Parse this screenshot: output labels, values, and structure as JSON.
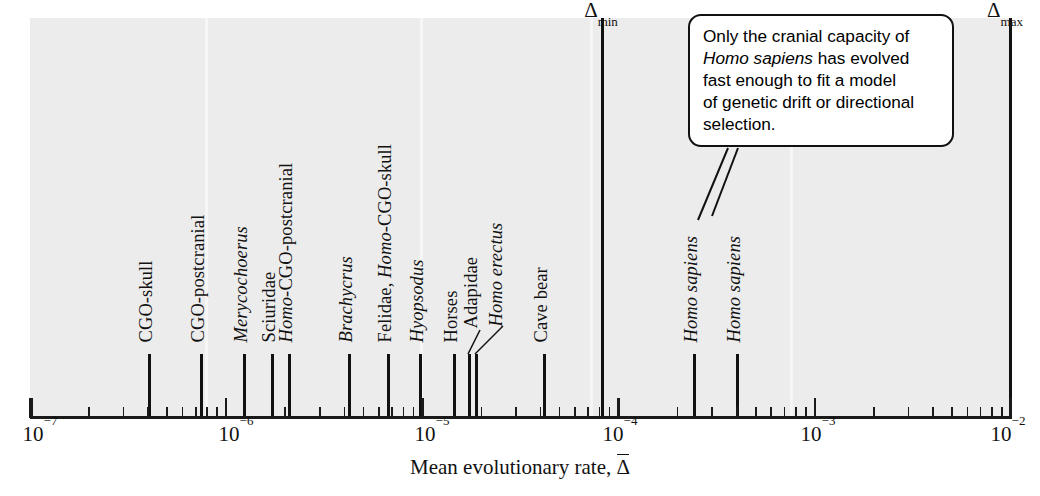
{
  "figure": {
    "background_color": "#ececec",
    "axis_title": "Mean evolutionary rate,",
    "axis_title_symbol": "Δ"
  },
  "chart_data": {
    "type": "scatter",
    "title": "",
    "xlabel": "Mean evolutionary rate, Δ̄",
    "ylabel": "",
    "xscale": "log",
    "xlim": [
      1e-07,
      0.01
    ],
    "grid": false,
    "legend": "none",
    "x_tick_labels": [
      "10⁻⁷",
      "10⁻⁶",
      "10⁻⁵",
      "10⁻⁴",
      "10⁻³",
      "10⁻²"
    ],
    "x_tick_values": [
      1e-07,
      1e-06,
      1e-05,
      0.0001,
      0.001,
      0.01
    ],
    "points": [
      {
        "label": "CGO-skull",
        "italic_prefix": "",
        "value": 6e-07
      },
      {
        "label": "CGO-postcranial",
        "italic_prefix": "",
        "value": 1.15e-06
      },
      {
        "label": "Merycochoerus",
        "italic_all": true,
        "value": 1.9e-06
      },
      {
        "label": "Sciuridae",
        "italic_prefix": "",
        "value": 2.6e-06
      },
      {
        "label": "-CGO-postcranial",
        "italic_prefix": "Homo",
        "value": 2.9e-06
      },
      {
        "label": "Brachycrus",
        "italic_all": true,
        "value": 5.4e-06
      },
      {
        "label": "Felidae, ",
        "italic_suffix": "Homo",
        "label_tail": "-CGO-skull",
        "value": 8.4e-06
      },
      {
        "label": "Hyopsodus",
        "italic_all": true,
        "value": 1.2e-05
      },
      {
        "label": "Horses",
        "italic_prefix": "",
        "value": 1.65e-05
      },
      {
        "label": "Adapidae",
        "italic_prefix": "",
        "value": 1.95e-05,
        "leader": true
      },
      {
        "label": "Homo erectus",
        "italic_all": true,
        "value": 2.05e-05,
        "leader": true
      },
      {
        "label": "Cave bear",
        "italic_prefix": "",
        "value": 4.4e-05
      },
      {
        "label": "Homo sapiens",
        "italic_all": true,
        "value": 0.000245
      },
      {
        "label": "Homo sapiens",
        "italic_all": true,
        "value": 0.00033
      }
    ],
    "boundaries": [
      {
        "name": "delta-min",
        "symbol": "Δ",
        "subscript": "min",
        "value": 0.0001
      },
      {
        "name": "delta-max",
        "symbol": "Δ",
        "subscript": "max",
        "value": 0.01
      }
    ],
    "annotations": [
      {
        "name": "callout",
        "lines": [
          "Only the cranial capacity of",
          "Homo sapiens has evolved",
          "fast enough to fit a model",
          "of genetic drift or directional",
          "selection."
        ],
        "italic_phrase": "Homo sapiens",
        "points_to": [
          "Homo sapiens",
          "Homo sapiens"
        ]
      }
    ]
  },
  "labels": {
    "l0": "CGO-skull",
    "l1": "CGO-postcranial",
    "l2": "Merycochoerus",
    "l3": "Sciuridae",
    "l4_italic": "Homo",
    "l4_rest": "-CGO-postcranial",
    "l5": "Brachycrus",
    "l6_pre": "Felidae, ",
    "l6_italic": "Homo",
    "l6_rest": "-CGO-skull",
    "l7": "Hyopsodus",
    "l8": "Horses",
    "l9": "Adapidae",
    "l10": "Homo erectus",
    "l11": "Cave bear",
    "l12": "Homo sapiens",
    "l13": "Homo sapiens"
  },
  "callout": {
    "line1": "Only the cranial capacity of",
    "line2_italic": "Homo sapiens",
    "line2_rest": " has evolved",
    "line3": "fast enough to fit a model",
    "line4": "of genetic drift or directional",
    "line5": "selection."
  },
  "ticks": {
    "t1": "10",
    "t1e": "−7",
    "t2": "10",
    "t2e": "−6",
    "t3": "10",
    "t3e": "−5",
    "t4": "10",
    "t4e": "−4",
    "t5": "10",
    "t5e": "−3",
    "t6": "10",
    "t6e": "−2"
  },
  "bounds": {
    "min_symbol": "Δ",
    "min_sub": "min",
    "max_symbol": "Δ",
    "max_sub": "max"
  }
}
